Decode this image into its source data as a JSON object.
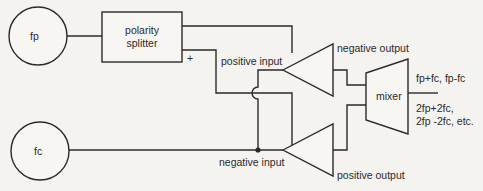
{
  "diagram": {
    "colors": {
      "line": "#2a2a2a",
      "background": "#f4f3ef"
    },
    "sources": [
      {
        "id": "fp",
        "label": "fp"
      },
      {
        "id": "fc",
        "label": "fc"
      }
    ],
    "blocks": {
      "splitter": {
        "line1": "polarity",
        "line2": "splitter",
        "plus_label": "+"
      },
      "mixer": {
        "label": "mixer"
      }
    },
    "amplifiers": {
      "top": {
        "input_label": "positive input",
        "output_label": "negative output"
      },
      "bottom": {
        "input_label": "negative input",
        "output_label": "positive output"
      }
    },
    "outputs": {
      "line1": "fp+fc, fp-fc",
      "line2": "2fp+2fc,",
      "line3": "2fp -2fc, etc."
    },
    "connections": [
      {
        "from": "fp",
        "to": "splitter"
      },
      {
        "from": "splitter.top",
        "to": "amplifier-top"
      },
      {
        "from": "splitter.plus",
        "to": "amplifier-bottom",
        "crossing": "hop"
      },
      {
        "from": "fc",
        "to": "amplifier-bottom",
        "junction": true
      },
      {
        "from": "fc.junction",
        "to": "amplifier-top"
      },
      {
        "from": "amplifier-top",
        "to": "mixer"
      },
      {
        "from": "amplifier-bottom",
        "to": "mixer"
      },
      {
        "from": "mixer",
        "to": "outputs"
      }
    ]
  }
}
